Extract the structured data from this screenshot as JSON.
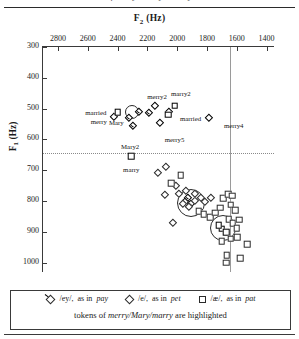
{
  "figure": {
    "top_caption": "of merry / Mary / marry",
    "x_axis_title": "F2 (Hz)",
    "x_axis_sub": "2",
    "y_axis_title": "F1 (Hz)",
    "y_axis_sub": "1"
  },
  "legend": {
    "items": [
      {
        "glyph": "diamond-with-tail-icon",
        "symbol": "/ey/,",
        "text": "as in",
        "word": "pay"
      },
      {
        "glyph": "diamond-icon",
        "symbol": "/e/,",
        "text": "as in",
        "word": "pet"
      },
      {
        "glyph": "square-icon",
        "symbol": "/æ/,",
        "text": "as in",
        "word": "pat"
      }
    ],
    "note_prefix": "tokens of ",
    "note_words": "merry/Mary/marry",
    "note_suffix": " are highlighted"
  },
  "chart_data": {
    "type": "scatter",
    "title": "",
    "xlabel": "F2 (Hz)",
    "ylabel": "F1 (Hz)",
    "xlim": [
      2900,
      1350
    ],
    "ylim": [
      1030,
      300
    ],
    "x_reversed": true,
    "y_reversed": true,
    "grid": false,
    "legend_position": "bottom",
    "xticks": [
      2800,
      2600,
      2400,
      2200,
      2000,
      1800,
      1600,
      1400
    ],
    "yticks": [
      300,
      400,
      500,
      600,
      700,
      800,
      900,
      1000
    ],
    "reference_lines": [
      {
        "orientation": "vertical",
        "x": 1648,
        "style": "solid",
        "color": "#9a9a9a"
      },
      {
        "orientation": "horizontal",
        "y": 645,
        "style": "dotted",
        "color": "#8a8a8a"
      }
    ],
    "highlight_circles": [
      {
        "x": 1905,
        "y": 807,
        "r_px": 13
      },
      {
        "x": 1690,
        "y": 888,
        "r_px": 12
      },
      {
        "x": 2305,
        "y": 512,
        "r_px": 6
      }
    ],
    "series": [
      {
        "name": "/ey/, as in pay",
        "marker": "diamond-with-tail",
        "points": [
          {
            "x": 2300,
            "y": 540,
            "label": "Mary",
            "label_dx": -16,
            "label_dy": 1,
            "highlight": true
          },
          {
            "x": 2275,
            "y": 567,
            "label": "Mary2",
            "label_dx": -6,
            "label_dy": 17,
            "highlight": true
          },
          {
            "x": 2235,
            "y": 520,
            "label": "",
            "highlight": true
          },
          {
            "x": 2168,
            "y": 523,
            "label": "",
            "highlight": true
          },
          {
            "x": 1905,
            "y": 800,
            "label": "",
            "highlight": true
          },
          {
            "x": 1930,
            "y": 812,
            "label": "",
            "highlight": true
          },
          {
            "x": 1885,
            "y": 818,
            "label": "",
            "highlight": true
          }
        ]
      },
      {
        "name": "/e/, as in pet",
        "marker": "diamond",
        "points": [
          {
            "x": 2405,
            "y": 538,
            "label": "merry",
            "label_dx": -18,
            "label_dy": 1,
            "highlight": true
          },
          {
            "x": 2128,
            "y": 500,
            "label": "merry2",
            "label_dx": -1,
            "label_dy": -13,
            "highlight": true
          },
          {
            "x": 2098,
            "y": 556,
            "label": "merry5",
            "label_dx": 12,
            "label_dy": 13,
            "highlight": true
          },
          {
            "x": 1768,
            "y": 540,
            "label": "merry4",
            "label_dx": 22,
            "label_dy": 4,
            "highlight": true
          },
          {
            "x": 2035,
            "y": 522,
            "label": "",
            "highlight": true
          },
          {
            "x": 2055,
            "y": 700,
            "label": ""
          },
          {
            "x": 2110,
            "y": 718,
            "label": ""
          },
          {
            "x": 1990,
            "y": 760,
            "label": ""
          },
          {
            "x": 1968,
            "y": 788,
            "label": ""
          },
          {
            "x": 1938,
            "y": 818,
            "label": ""
          },
          {
            "x": 1900,
            "y": 828,
            "label": ""
          },
          {
            "x": 1858,
            "y": 810,
            "label": ""
          },
          {
            "x": 1818,
            "y": 800,
            "label": ""
          },
          {
            "x": 1790,
            "y": 812,
            "label": ""
          },
          {
            "x": 1752,
            "y": 800,
            "label": ""
          },
          {
            "x": 1862,
            "y": 788,
            "label": ""
          },
          {
            "x": 1920,
            "y": 778,
            "label": ""
          },
          {
            "x": 2010,
            "y": 882,
            "label": ""
          },
          {
            "x": 2058,
            "y": 790,
            "label": ""
          }
        ]
      },
      {
        "name": "/æ/, as in pat",
        "marker": "square",
        "points": [
          {
            "x": 2398,
            "y": 512,
            "label": "married",
            "label_dx": -22,
            "label_dy": 0,
            "highlight": true
          },
          {
            "x": 2058,
            "y": 520,
            "label": "married",
            "label_dx": 22,
            "label_dy": 3,
            "highlight": true
          },
          {
            "x": 2015,
            "y": 490,
            "label": "marry2",
            "label_dx": 6,
            "label_dy": -13,
            "highlight": true
          },
          {
            "x": 2308,
            "y": 655,
            "label": "marry",
            "label_dx": 0,
            "label_dy": 13,
            "highlight": true
          },
          {
            "x": 1700,
            "y": 890,
            "label": "",
            "highlight": true
          },
          {
            "x": 1722,
            "y": 878,
            "label": "",
            "highlight": true
          },
          {
            "x": 1672,
            "y": 900,
            "label": "",
            "highlight": true
          },
          {
            "x": 1855,
            "y": 832,
            "label": ""
          },
          {
            "x": 1822,
            "y": 842,
            "label": ""
          },
          {
            "x": 1780,
            "y": 852,
            "label": ""
          },
          {
            "x": 1745,
            "y": 838,
            "label": ""
          },
          {
            "x": 1712,
            "y": 822,
            "label": ""
          },
          {
            "x": 1690,
            "y": 790,
            "label": ""
          },
          {
            "x": 1658,
            "y": 778,
            "label": ""
          },
          {
            "x": 1630,
            "y": 782,
            "label": ""
          },
          {
            "x": 1640,
            "y": 812,
            "label": ""
          },
          {
            "x": 1612,
            "y": 830,
            "label": ""
          },
          {
            "x": 1655,
            "y": 858,
            "label": ""
          },
          {
            "x": 1628,
            "y": 872,
            "label": ""
          },
          {
            "x": 1600,
            "y": 888,
            "label": ""
          },
          {
            "x": 1585,
            "y": 860,
            "label": ""
          },
          {
            "x": 1598,
            "y": 918,
            "label": ""
          },
          {
            "x": 1640,
            "y": 922,
            "label": ""
          },
          {
            "x": 1700,
            "y": 930,
            "label": ""
          },
          {
            "x": 1668,
            "y": 975,
            "label": ""
          },
          {
            "x": 1672,
            "y": 1000,
            "label": ""
          },
          {
            "x": 1575,
            "y": 985,
            "label": ""
          },
          {
            "x": 1530,
            "y": 940,
            "label": ""
          },
          {
            "x": 2038,
            "y": 742,
            "label": ""
          },
          {
            "x": 1975,
            "y": 715,
            "label": ""
          }
        ]
      }
    ]
  }
}
